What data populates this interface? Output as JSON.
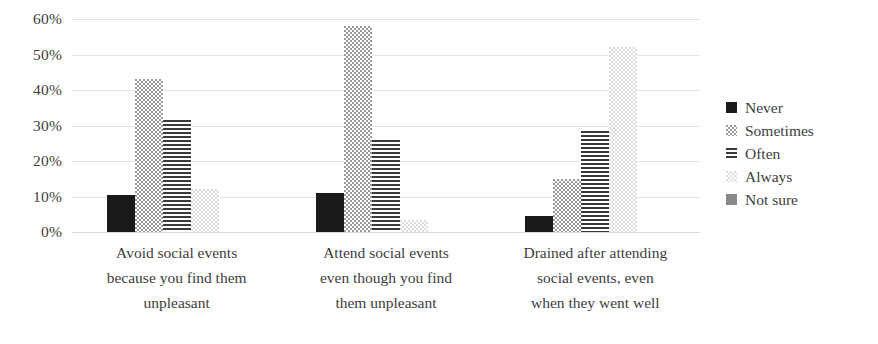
{
  "chart_data": {
    "type": "bar",
    "title": "",
    "subtitle": "",
    "xlabel": "",
    "ylabel": "",
    "grid": true,
    "legend_position": "right",
    "ylim": [
      0,
      60
    ],
    "ytick_labels": [
      "60%",
      "50%",
      "40%",
      "30%",
      "20%",
      "10%",
      "0%"
    ],
    "ytick_values": [
      60,
      50,
      40,
      30,
      20,
      10,
      0
    ],
    "categories": [
      "Avoid social events because you find them unpleasant",
      "Attend social events even though you find them unpleasant",
      "Drained after attending social events, even when they went well"
    ],
    "category_lines": [
      [
        "Avoid social events",
        "because you find them",
        "unpleasant"
      ],
      [
        "Attend social events",
        "even though you find",
        "them unpleasant"
      ],
      [
        "Drained after attending",
        "social events, even",
        "when they went well"
      ]
    ],
    "series": [
      {
        "name": "Never",
        "pattern": "solid-black",
        "color": "#1a1a1a",
        "values": [
          10.5,
          11.0,
          4.5
        ]
      },
      {
        "name": "Sometimes",
        "pattern": "dotted-grey",
        "color": "#9a9a9a",
        "values": [
          43.0,
          58.0,
          15.0
        ]
      },
      {
        "name": "Often",
        "pattern": "horizontal-lines",
        "color": "#3a3a3a",
        "values": [
          31.5,
          26.0,
          28.5
        ]
      },
      {
        "name": "Always",
        "pattern": "dotted-light",
        "color": "#dcdcdc",
        "values": [
          12.0,
          3.5,
          52.0
        ]
      },
      {
        "name": "Not sure",
        "pattern": "solid-grey",
        "color": "#8a8a8a",
        "values": [
          0,
          0,
          0
        ]
      }
    ]
  },
  "legend": {
    "items": [
      {
        "label": "Never",
        "swatch": "swatch-never-icon"
      },
      {
        "label": "Sometimes",
        "swatch": "swatch-sometimes-icon"
      },
      {
        "label": "Often",
        "swatch": "swatch-often-icon"
      },
      {
        "label": "Always",
        "swatch": "swatch-always-icon"
      },
      {
        "label": "Not sure",
        "swatch": "swatch-not-sure-icon"
      }
    ]
  }
}
